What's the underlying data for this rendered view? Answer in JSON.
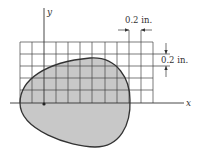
{
  "diagram": {
    "axes": {
      "x_label": "x",
      "y_label": "y"
    },
    "grid": {
      "columns": 11,
      "rows": 5,
      "cell_size_label": "0.2 in."
    },
    "dimensions": {
      "horizontal": "0.2 in.",
      "vertical": "0.2 in."
    },
    "colors": {
      "shape_fill": "#c8c8c8",
      "lines": "#333333"
    }
  }
}
